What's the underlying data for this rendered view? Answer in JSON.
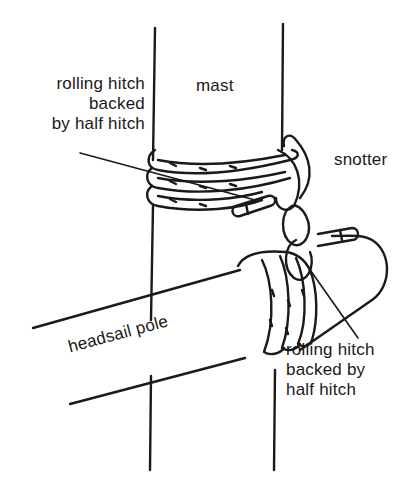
{
  "figure": {
    "caption_cropped": "",
    "labels": {
      "top_hitch": [
        "rolling hitch",
        "backed",
        "by half hitch"
      ],
      "mast": "mast",
      "snotter": "snotter",
      "pole": "headsail pole",
      "bottom_hitch": [
        "rolling hitch",
        "backed by",
        "half hitch"
      ]
    },
    "colors": {
      "ink": "#1a1a1a",
      "background": "#ffffff"
    }
  }
}
